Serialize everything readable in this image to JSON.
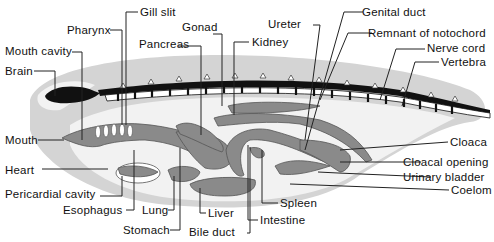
{
  "figure": {
    "colors": {
      "background": "#ffffff",
      "body_outline": "#d4d4d4",
      "coelom": "#f0f0f0",
      "organs": "#8a8a8a",
      "brain_nerve": "#111111",
      "text": "#111111"
    }
  },
  "labels": {
    "gill_slit": "Gill slit",
    "pharynx": "Pharynx",
    "gonad": "Gonad",
    "ureter": "Ureter",
    "genital_duct": "Genital duct",
    "mouth_cavity": "Mouth cavity",
    "pancreas": "Pancreas",
    "kidney": "Kidney",
    "remnant_notochord": "Remnant of notochord",
    "nerve_cord": "Nerve cord",
    "brain": "Brain",
    "vertebra": "Vertebra",
    "mouth": "Mouth",
    "heart": "Heart",
    "pericardial_cavity": "Pericardial cavity",
    "esophagus": "Esophagus",
    "lung": "Lung",
    "stomach": "Stomach",
    "liver": "Liver",
    "bile_duct": "Bile duct",
    "intestine": "Intestine",
    "spleen": "Spleen",
    "cloaca": "Cloaca",
    "cloacal_opening": "Cloacal opening",
    "urinary_bladder": "Urinary bladder",
    "coelom": "Coelom"
  }
}
